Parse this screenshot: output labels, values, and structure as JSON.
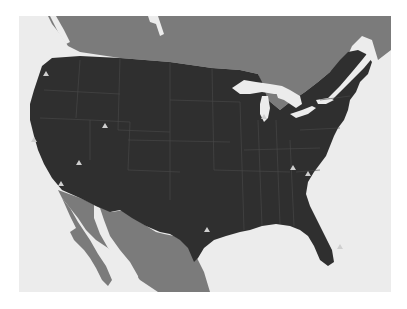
{
  "map": {
    "type": "region-map",
    "region": "Contiguous United States",
    "colors": {
      "ocean": "#ececec",
      "neighbor_land": "#7b7b7b",
      "us_land": "#2f2f2f",
      "state_borders": "#4a4a4a",
      "lakes": "#ececec",
      "marker": "#cfcfcf"
    },
    "markers": [
      {
        "id": "m1",
        "shape": "triangle",
        "x": 46,
        "y": 74
      },
      {
        "id": "m2",
        "shape": "triangle",
        "x": 105,
        "y": 126
      },
      {
        "id": "m3",
        "shape": "triangle",
        "x": 34,
        "y": 140
      },
      {
        "id": "m4",
        "shape": "triangle",
        "x": 79,
        "y": 163
      },
      {
        "id": "m5",
        "shape": "triangle",
        "x": 61,
        "y": 184
      },
      {
        "id": "m6",
        "shape": "triangle",
        "x": 207,
        "y": 230
      },
      {
        "id": "m7",
        "shape": "triangle",
        "x": 264,
        "y": 117
      },
      {
        "id": "m8",
        "shape": "triangle",
        "x": 293,
        "y": 168
      },
      {
        "id": "m9",
        "shape": "triangle",
        "x": 308,
        "y": 174
      },
      {
        "id": "m10",
        "shape": "triangle",
        "x": 340,
        "y": 247
      }
    ]
  }
}
